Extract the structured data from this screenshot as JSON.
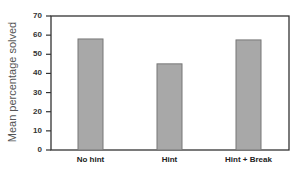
{
  "chart_data": {
    "type": "bar",
    "title": "",
    "xlabel": "",
    "ylabel": "Mean percentage solved",
    "categories": [
      "No hint",
      "Hint",
      "Hint + Break"
    ],
    "values": [
      58,
      45,
      57.5
    ],
    "ylim": [
      0,
      70
    ],
    "yticks": [
      0,
      10,
      20,
      30,
      40,
      50,
      60,
      70
    ],
    "ytick_labels": [
      "0",
      "10",
      "20",
      "30",
      "40",
      "50",
      "60",
      "70"
    ],
    "grid": false,
    "legend": null,
    "bar_color": "#a8a8a8",
    "bar_edge_color": "#777777",
    "frame_color": "#333333"
  }
}
